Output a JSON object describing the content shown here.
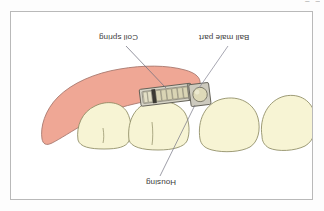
{
  "figure": {
    "frame_border_color": "#b9b9b9",
    "background_color": "#ffffff",
    "text_orientation": "rotated-180"
  },
  "labels": {
    "coil_spring": "Coil spring",
    "ball_male_part": "Ball male part",
    "housing": "Housing"
  },
  "artifacts": {
    "top_edge_marks": "–– ––"
  },
  "colors": {
    "gingiva": "#eda292",
    "gingiva_fill": "#efa795",
    "gingiva_stroke": "#a8796f",
    "tooth_fill": "#f7f4d4",
    "tooth_stroke": "#8d8a62",
    "appliance_body": "#c9c6bc",
    "appliance_light": "#e6e3d8",
    "appliance_dark": "#4a4740",
    "coil_fill": "#d8d3b6",
    "ball_fill": "#ded9b8",
    "leader_line": "#7b7b8a",
    "label_text": "#3a3a3a"
  },
  "anatomy": {
    "teeth": [
      {
        "name": "premolar-left",
        "position": "left"
      },
      {
        "name": "premolar-mid",
        "position": "center-left"
      },
      {
        "name": "molar-first",
        "position": "center-right"
      },
      {
        "name": "molar-second",
        "position": "right"
      }
    ],
    "gingiva": "edentulous ridge with overlying soft tissue"
  },
  "appliance": {
    "components": [
      {
        "name": "coil-spring",
        "description": "segmented coil within cylindrical housing"
      },
      {
        "name": "housing",
        "description": "metal sleeve enclosing the coil spring"
      },
      {
        "name": "ball-male-part",
        "description": "spherical male attachment in square block"
      }
    ]
  },
  "leaders": [
    {
      "name": "coil-spring-leader",
      "from": "label",
      "to": "coil spring body"
    },
    {
      "name": "ball-male-part-leader",
      "from": "label",
      "to": "ball attachment"
    },
    {
      "name": "housing-leader",
      "from": "label",
      "to": "housing sleeve"
    }
  ]
}
